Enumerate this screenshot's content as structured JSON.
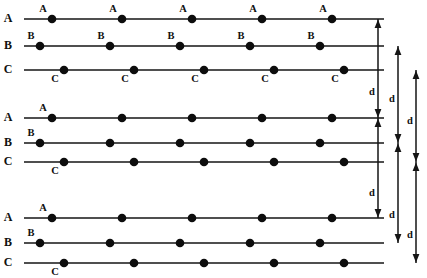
{
  "figure": {
    "line_color": "#151515",
    "dot_color": "#0d0d0d",
    "background": "#ffffff",
    "row_labels": [
      "A",
      "B",
      "C"
    ],
    "dot_label_letters": {
      "a": "A",
      "b": "B",
      "c": "C"
    },
    "dimension_label": "d",
    "dimension_count": 3,
    "dots_per_row": 5,
    "groups": [
      {
        "name": "group-1",
        "labeled_dots": true,
        "rows": [
          {
            "label": "A",
            "y": 19,
            "x_start": 24,
            "x_end": 384,
            "dot_x": [
              52,
              122,
              192,
              262,
              332
            ],
            "label_pos": "above-left",
            "label_letter": "A"
          },
          {
            "label": "B",
            "y": 46,
            "x_start": 24,
            "x_end": 384,
            "dot_x": [
              40,
              110,
              180,
              250,
              320
            ],
            "label_pos": "above-left",
            "label_letter": "B"
          },
          {
            "label": "C",
            "y": 70,
            "x_start": 24,
            "x_end": 384,
            "dot_x": [
              64,
              134,
              204,
              274,
              344
            ],
            "label_pos": "below-left",
            "label_letter": "C"
          }
        ]
      },
      {
        "name": "group-2",
        "labeled_dots": false,
        "rows": [
          {
            "label": "A",
            "y": 118,
            "x_start": 24,
            "x_end": 384,
            "dot_x": [
              52,
              122,
              192,
              262,
              332
            ],
            "label_pos": "above-left",
            "label_letter": "A"
          },
          {
            "label": "B",
            "y": 143,
            "x_start": 24,
            "x_end": 384,
            "dot_x": [
              40,
              110,
              180,
              250,
              320
            ],
            "label_pos": "above-left",
            "label_letter": "B"
          },
          {
            "label": "C",
            "y": 162,
            "x_start": 24,
            "x_end": 384,
            "dot_x": [
              64,
              134,
              204,
              274,
              344
            ],
            "label_pos": "below-left",
            "label_letter": "C"
          }
        ]
      },
      {
        "name": "group-3",
        "labeled_dots": false,
        "rows": [
          {
            "label": "A",
            "y": 218,
            "x_start": 24,
            "x_end": 384,
            "dot_x": [
              52,
              122,
              192,
              262,
              332
            ],
            "label_pos": "above-left",
            "label_letter": "A"
          },
          {
            "label": "B",
            "y": 243,
            "x_start": 24,
            "x_end": 384,
            "dot_x": [
              40,
              110,
              180,
              250,
              320
            ],
            "label_pos": "above-left",
            "label_letter": "B"
          },
          {
            "label": "C",
            "y": 263,
            "x_start": 24,
            "x_end": 384,
            "dot_x": [
              64,
              134,
              204,
              274,
              344
            ],
            "label_pos": "below-left",
            "label_letter": "C"
          }
        ]
      }
    ],
    "dimensions": [
      {
        "name": "d-from-A",
        "x": 378,
        "y_top": 19,
        "y_bottom": 118,
        "label": "d",
        "label_y": 95
      },
      {
        "name": "d-from-B",
        "x": 398,
        "y_top": 46,
        "y_bottom": 143,
        "label": "d",
        "label_y": 102
      },
      {
        "name": "d-from-C",
        "x": 416,
        "y_top": 70,
        "y_bottom": 162,
        "label": "d",
        "label_y": 124
      },
      {
        "name": "d-from-A-2",
        "x": 378,
        "y_top": 118,
        "y_bottom": 218,
        "label": "d",
        "label_y": 196
      },
      {
        "name": "d-from-B-2",
        "x": 398,
        "y_top": 143,
        "y_bottom": 243,
        "label": "d",
        "label_y": 218
      },
      {
        "name": "d-from-C-2",
        "x": 416,
        "y_top": 162,
        "y_bottom": 263,
        "label": "d",
        "label_y": 238
      }
    ]
  }
}
